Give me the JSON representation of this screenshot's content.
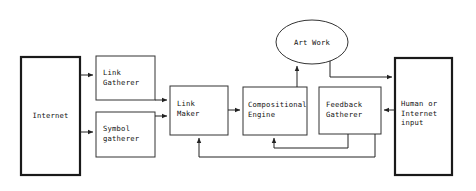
{
  "diagram": {
    "background_color": "#ffffff",
    "line_color": "#222222",
    "text_color": "#111111",
    "nodes": [
      {
        "id": "internet",
        "label": "Internet",
        "shape": "rectangle",
        "emphasis": "thick",
        "x": 21,
        "y": 57,
        "w": 59,
        "h": 118,
        "label_align": "center"
      },
      {
        "id": "link-gatherer",
        "label": "Link\nGatherer",
        "shape": "rectangle",
        "emphasis": "normal",
        "x": 96,
        "y": 56,
        "w": 59,
        "h": 44,
        "label_align": "left"
      },
      {
        "id": "symbol-gatherer",
        "label": "Symbol\ngatherer",
        "shape": "rectangle",
        "emphasis": "normal",
        "x": 96,
        "y": 112,
        "w": 59,
        "h": 45,
        "label_align": "left"
      },
      {
        "id": "link-maker",
        "label": "Link\nMaker",
        "shape": "rectangle",
        "emphasis": "normal",
        "x": 170,
        "y": 86,
        "w": 58,
        "h": 49,
        "label_align": "left"
      },
      {
        "id": "compositional-engine",
        "label": "Compositional\nEngine",
        "shape": "rectangle",
        "emphasis": "normal",
        "x": 243,
        "y": 87,
        "w": 64,
        "h": 48,
        "label_align": "left"
      },
      {
        "id": "feedback-gatherer",
        "label": "Feedback\nGatherer",
        "shape": "rectangle",
        "emphasis": "normal",
        "x": 319,
        "y": 87,
        "w": 62,
        "h": 47,
        "label_align": "left"
      },
      {
        "id": "art-work",
        "label": "Art Work",
        "shape": "ellipse",
        "emphasis": "normal",
        "x": 276,
        "y": 20,
        "w": 72,
        "h": 44,
        "label_align": "center"
      },
      {
        "id": "human-or-internet-input",
        "label": "Human or\nInternet\ninput",
        "shape": "rectangle",
        "emphasis": "thick",
        "x": 395,
        "y": 58,
        "w": 57,
        "h": 117,
        "label_align": "left"
      }
    ],
    "edges": [
      {
        "id": "internet-to-link-gatherer",
        "from": "internet",
        "to": "link-gatherer",
        "arrow": true
      },
      {
        "id": "internet-to-symbol-gatherer",
        "from": "internet",
        "to": "symbol-gatherer",
        "arrow": true
      },
      {
        "id": "link-gatherer-to-link-maker",
        "from": "link-gatherer",
        "to": "link-maker",
        "arrow": true
      },
      {
        "id": "symbol-gatherer-to-link-maker",
        "from": "symbol-gatherer",
        "to": "link-maker",
        "arrow": true
      },
      {
        "id": "link-maker-to-compositional-engine",
        "from": "link-maker",
        "to": "compositional-engine",
        "arrow": true
      },
      {
        "id": "compositional-engine-to-art-work",
        "from": "compositional-engine",
        "to": "art-work",
        "arrow": true
      },
      {
        "id": "art-work-to-human-input",
        "from": "art-work",
        "to": "human-or-internet-input",
        "arrow": true
      },
      {
        "id": "human-input-to-feedback-gatherer",
        "from": "human-or-internet-input",
        "to": "feedback-gatherer",
        "arrow": true
      },
      {
        "id": "feedback-gatherer-to-compositional-engine",
        "from": "feedback-gatherer",
        "to": "compositional-engine",
        "arrow": true
      },
      {
        "id": "human-input-to-link-maker",
        "from": "human-or-internet-input",
        "to": "link-maker",
        "arrow": true
      }
    ]
  }
}
